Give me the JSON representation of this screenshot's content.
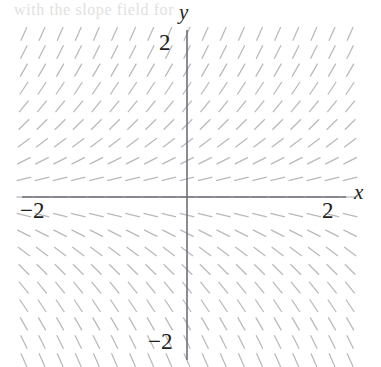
{
  "figure": {
    "name": "slope-field-plot",
    "width": 381,
    "height": 367,
    "background_color": "#ffffff",
    "ghost_text": "with the slope field for"
  },
  "axes": {
    "x_label": "x",
    "y_label": "y",
    "axis_color": "#6e6e78",
    "origin_px": {
      "x": 187,
      "y": 197
    },
    "unit_px": 72.5,
    "x_axis_extent_px": {
      "start": 22,
      "end": 346
    },
    "y_axis_extent_px": {
      "start": 30,
      "end": 360
    },
    "x_ticks": [
      {
        "value": -2,
        "label": "−2"
      },
      {
        "value": 2,
        "label": "2"
      }
    ],
    "y_ticks": [
      {
        "value": 2,
        "label": "2"
      },
      {
        "value": -2,
        "label": "−2"
      }
    ]
  },
  "chart_data": {
    "type": "scatter",
    "title": "",
    "subtitle": "",
    "xlabel": "x",
    "ylabel": "y",
    "xlim": [
      -2.3,
      2.3
    ],
    "ylim": [
      -2.3,
      2.3
    ],
    "grid": false,
    "legend": null,
    "annotations": [],
    "plot_kind": "slope-field",
    "equation": "dy/dx = y",
    "segment_color": "#b9b9bd",
    "segment_length_px": 15,
    "grid_columns": 19,
    "grid_rows": 19,
    "grid_x_values": [
      -2.25,
      -2.0,
      -1.75,
      -1.5,
      -1.25,
      -1.0,
      -0.75,
      -0.5,
      -0.25,
      0.0,
      0.25,
      0.5,
      0.75,
      1.0,
      1.25,
      1.5,
      1.75,
      2.0,
      2.25
    ],
    "grid_y_values": [
      2.25,
      2.0,
      1.75,
      1.5,
      1.25,
      1.0,
      0.75,
      0.5,
      0.25,
      0.0,
      -0.25,
      -0.5,
      -0.75,
      -1.0,
      -1.25,
      -1.5,
      -1.75,
      -2.0,
      -2.25
    ],
    "row_slopes": [
      {
        "y": 2.25,
        "slope": 2.25
      },
      {
        "y": 2.0,
        "slope": 2.0
      },
      {
        "y": 1.75,
        "slope": 1.75
      },
      {
        "y": 1.5,
        "slope": 1.5
      },
      {
        "y": 1.25,
        "slope": 1.25
      },
      {
        "y": 1.0,
        "slope": 1.0
      },
      {
        "y": 0.75,
        "slope": 0.75
      },
      {
        "y": 0.5,
        "slope": 0.5
      },
      {
        "y": 0.25,
        "slope": 0.25
      },
      {
        "y": 0.0,
        "slope": 0.0
      },
      {
        "y": -0.25,
        "slope": -0.25
      },
      {
        "y": -0.5,
        "slope": -0.5
      },
      {
        "y": -0.75,
        "slope": -0.75
      },
      {
        "y": -1.0,
        "slope": -1.0
      },
      {
        "y": -1.25,
        "slope": -1.25
      },
      {
        "y": -1.5,
        "slope": -1.5
      },
      {
        "y": -1.75,
        "slope": -1.75
      },
      {
        "y": -2.0,
        "slope": -2.0
      },
      {
        "y": -2.25,
        "slope": -2.25
      }
    ]
  }
}
